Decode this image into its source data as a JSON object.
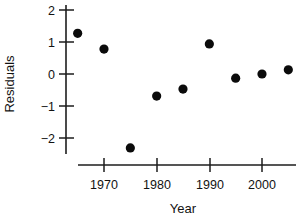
{
  "chart_data": {
    "type": "scatter",
    "title": "",
    "xlabel": "Year",
    "ylabel": "Residuals",
    "x": [
      1965,
      1970,
      1975,
      1980,
      1985,
      1990,
      1995,
      2000,
      2005
    ],
    "values": [
      1.27,
      0.78,
      -2.31,
      -0.69,
      -0.47,
      0.94,
      -0.13,
      0.0,
      0.13
    ],
    "series": [
      {
        "name": "Residuals",
        "points": [
          {
            "x": 1965,
            "y": 1.27
          },
          {
            "x": 1970,
            "y": 0.78
          },
          {
            "x": 1975,
            "y": -2.31
          },
          {
            "x": 1980,
            "y": -0.69
          },
          {
            "x": 1985,
            "y": -0.47
          },
          {
            "x": 1990,
            "y": 0.94
          },
          {
            "x": 1995,
            "y": -0.13
          },
          {
            "x": 2000,
            "y": 0.0
          },
          {
            "x": 2005,
            "y": 0.13
          }
        ]
      }
    ],
    "xlim": [
      1962,
      2008
    ],
    "ylim": [
      -2.6,
      2.2
    ],
    "xticks": [
      1970,
      1980,
      1990,
      2000
    ],
    "xtick_labels": [
      "1970",
      "1980",
      "1990",
      "2000"
    ],
    "yticks": [
      2,
      1,
      0,
      -1,
      -2
    ],
    "ytick_labels": [
      "2",
      "1",
      "0",
      "−1",
      "−2"
    ],
    "grid": false,
    "legend": false,
    "marker": "filled-circle",
    "marker_color": "#0b0b0b",
    "axis_color": "#1d1d1d",
    "axis_style": "detached-floating"
  },
  "labels": {
    "y_axis_title": "Residuals",
    "x_axis_title": "Year",
    "ytick_2": "2",
    "ytick_1": "1",
    "ytick_0": "0",
    "ytick_m1": "−1",
    "ytick_m2": "−2",
    "xtick_1970": "1970",
    "xtick_1980": "1980",
    "xtick_1990": "1990",
    "xtick_2000": "2000"
  }
}
